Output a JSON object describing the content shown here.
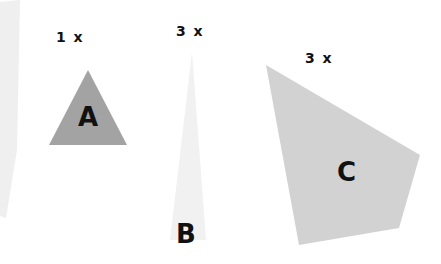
{
  "canvas": {
    "width": 441,
    "height": 264,
    "background": "#ffffff"
  },
  "figure": {
    "title": ""
  },
  "shapes": [
    {
      "id": "wedge-left",
      "letter": "",
      "scale_label": "",
      "fill": "#efefef",
      "points": "0,2 20,0 17,150 6,218 0,216",
      "kind": "sliver-wedge"
    },
    {
      "id": "triangle-a",
      "letter": "A",
      "scale_label": "1 x",
      "fill": "#a3a3a3",
      "points": "88,70 127,145 49,145",
      "kind": "triangle"
    },
    {
      "id": "wedge-b",
      "letter": "B",
      "scale_label": "3 x",
      "fill": "#f1f1f1",
      "points": "192,52 206,240 170,240",
      "kind": "tall-narrow-triangle"
    },
    {
      "id": "quad-c",
      "letter": "C",
      "scale_label": "3 x",
      "fill": "#d2d2d2",
      "points": "266,65 420,155 399,228 299,245",
      "kind": "quadrilateral"
    }
  ],
  "labels": {
    "scale_a": "1 x",
    "scale_b": "3 x",
    "scale_c": "3 x",
    "letter_a": "A",
    "letter_b": "B",
    "letter_c": "C"
  },
  "colors": {
    "background": "#ffffff",
    "text": "#111111",
    "fill_a": "#a3a3a3",
    "fill_b": "#f1f1f1",
    "fill_c": "#d2d2d2",
    "fill_left_wedge": "#efefef"
  }
}
